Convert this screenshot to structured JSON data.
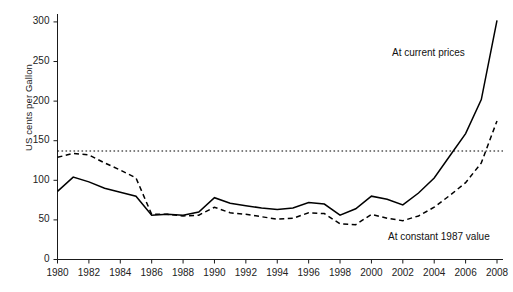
{
  "chart_data": {
    "type": "line",
    "title": "",
    "xlabel": "",
    "ylabel": "US cents per Gallon",
    "xlim": [
      1980,
      2008
    ],
    "ylim": [
      0,
      310
    ],
    "yticks": [
      0,
      50,
      100,
      150,
      200,
      250,
      300
    ],
    "xticks": [
      1980,
      1982,
      1984,
      1986,
      1988,
      1990,
      1992,
      1994,
      1996,
      1998,
      2000,
      2002,
      2004,
      2006,
      2008
    ],
    "grid": false,
    "legend_position": "inline-annotations",
    "x": [
      1980,
      1981,
      1982,
      1983,
      1984,
      1985,
      1986,
      1987,
      1988,
      1989,
      1990,
      1991,
      1992,
      1993,
      1994,
      1995,
      1996,
      1997,
      1998,
      1999,
      2000,
      2001,
      2002,
      2003,
      2004,
      2005,
      2006,
      2007,
      2008
    ],
    "series": [
      {
        "name": "At current prices",
        "style": "solid",
        "color": "#000000",
        "values": [
          86,
          104,
          98,
          90,
          85,
          80,
          56,
          57,
          56,
          60,
          78,
          71,
          68,
          65,
          63,
          65,
          72,
          70,
          56,
          64,
          80,
          76,
          69,
          84,
          103,
          131,
          159,
          202,
          302
        ]
      },
      {
        "name": "At constant 1987 value",
        "style": "dashed",
        "color": "#000000",
        "values": [
          129,
          134,
          132,
          122,
          113,
          103,
          57,
          57,
          55,
          56,
          66,
          59,
          57,
          54,
          51,
          52,
          59,
          58,
          45,
          44,
          57,
          52,
          49,
          55,
          66,
          81,
          97,
          122,
          175
        ]
      }
    ],
    "reference_line": {
      "name": "reference-dotted-line",
      "value": 137,
      "style": "dotted",
      "color": "#000000"
    },
    "annotations": [
      {
        "name": "annotation-current-prices",
        "text": "At current prices",
        "x_px": 392,
        "y_px": 47
      },
      {
        "name": "annotation-constant-value",
        "text": "At constant 1987 value",
        "x_px": 388,
        "y_px": 231
      }
    ]
  }
}
